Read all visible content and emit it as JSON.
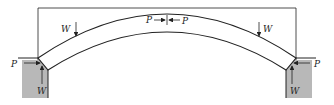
{
  "diagram": {
    "labels": {
      "w_left_load": "W",
      "w_right_load": "W",
      "p_crown_left": "P",
      "p_crown_right": "P",
      "p_left_support": "P",
      "p_right_support": "P",
      "w_left_reaction": "W",
      "w_right_reaction": "W"
    },
    "colors": {
      "stroke": "#222222",
      "support_fill": "#b8b8b8",
      "background": "#ffffff"
    }
  }
}
